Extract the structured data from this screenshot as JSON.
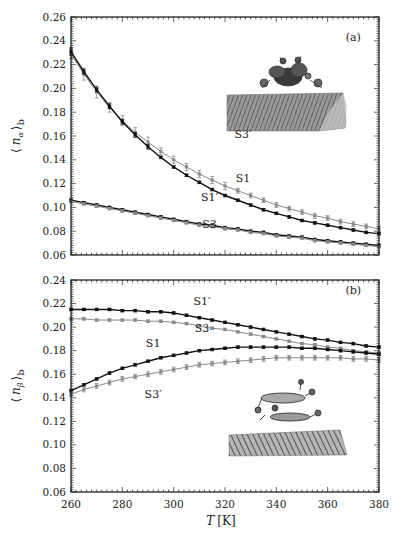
{
  "chart_data": [
    {
      "type": "line",
      "panel": "(a)",
      "xlabel": "",
      "ylabel": "⟨ n_α ⟩_b",
      "ylabel_main": "n",
      "ylabel_sub": "α",
      "ylabel_outer_sub": "b",
      "xlim": [
        260,
        380
      ],
      "ylim": [
        0.06,
        0.26
      ],
      "yticks": [
        0.06,
        0.08,
        0.1,
        0.12,
        0.14,
        0.16,
        0.18,
        0.2,
        0.22,
        0.24,
        0.26
      ],
      "ytick_labels": [
        "0.06",
        "0.08",
        "0.10",
        "0.12",
        "0.14",
        "0.16",
        "0.18",
        "0.20",
        "0.22",
        "0.24",
        "0.26"
      ],
      "x": [
        260,
        265,
        270,
        275,
        280,
        285,
        290,
        295,
        300,
        305,
        310,
        315,
        320,
        325,
        330,
        335,
        340,
        345,
        350,
        355,
        360,
        365,
        370,
        375,
        380
      ],
      "series": [
        {
          "name": "S3′",
          "color": "#8a8a8a",
          "values": [
            0.229,
            0.212,
            0.197,
            0.184,
            0.173,
            0.163,
            0.155,
            0.147,
            0.14,
            0.134,
            0.128,
            0.123,
            0.118,
            0.114,
            0.11,
            0.106,
            0.102,
            0.099,
            0.096,
            0.093,
            0.091,
            0.088,
            0.086,
            0.084,
            0.082
          ],
          "errors": [
            0.004,
            0.005,
            0.005,
            0.004,
            0.004,
            0.004,
            0.004,
            0.003,
            0.003,
            0.003,
            0.003,
            0.003,
            0.003,
            0.002,
            0.002,
            0.002,
            0.002,
            0.002,
            0.002,
            0.002,
            0.002,
            0.002,
            0.002,
            0.002,
            0.002
          ]
        },
        {
          "name": "S1",
          "color": "#111111",
          "values": [
            0.231,
            0.214,
            0.199,
            0.185,
            0.172,
            0.161,
            0.151,
            0.142,
            0.134,
            0.127,
            0.121,
            0.115,
            0.11,
            0.106,
            0.102,
            0.098,
            0.095,
            0.092,
            0.089,
            0.087,
            0.085,
            0.083,
            0.081,
            0.079,
            0.078
          ],
          "errors": [
            0.003,
            0.002,
            0.002,
            0.002,
            0.002,
            0.002,
            0.002,
            0.001,
            0.001,
            0.001,
            0.001,
            0.001,
            0.001,
            0.001,
            0.001,
            0.001,
            0.001,
            0.001,
            0.001,
            0.001,
            0.001,
            0.001,
            0.001,
            0.001,
            0.001
          ]
        },
        {
          "name": "S1′",
          "color": "#111111",
          "values": [
            0.106,
            0.104,
            0.102,
            0.1,
            0.098,
            0.096,
            0.094,
            0.092,
            0.09,
            0.088,
            0.086,
            0.085,
            0.083,
            0.082,
            0.08,
            0.079,
            0.077,
            0.076,
            0.075,
            0.073,
            0.072,
            0.071,
            0.07,
            0.069,
            0.068
          ],
          "errors": [
            0.001,
            0.001,
            0.001,
            0.001,
            0.001,
            0.001,
            0.001,
            0.001,
            0.001,
            0.001,
            0.001,
            0.001,
            0.001,
            0.001,
            0.001,
            0.001,
            0.001,
            0.001,
            0.001,
            0.001,
            0.001,
            0.001,
            0.001,
            0.001,
            0.001
          ]
        },
        {
          "name": "S3",
          "color": "#8a8a8a",
          "values": [
            0.105,
            0.103,
            0.101,
            0.099,
            0.097,
            0.095,
            0.093,
            0.091,
            0.089,
            0.087,
            0.085,
            0.084,
            0.082,
            0.081,
            0.079,
            0.078,
            0.076,
            0.075,
            0.074,
            0.072,
            0.071,
            0.07,
            0.069,
            0.068,
            0.067
          ],
          "errors": [
            0.001,
            0.001,
            0.001,
            0.001,
            0.001,
            0.001,
            0.001,
            0.001,
            0.001,
            0.001,
            0.001,
            0.001,
            0.001,
            0.001,
            0.001,
            0.001,
            0.001,
            0.001,
            0.001,
            0.001,
            0.001,
            0.001,
            0.001,
            0.001,
            0.001
          ]
        }
      ],
      "annotations": [
        {
          "text": "S3′",
          "x": 327,
          "y": 0.158
        },
        {
          "text": "S1",
          "x": 327,
          "y": 0.121
        },
        {
          "text": "S1′",
          "x": 314,
          "y": 0.105
        },
        {
          "text": "S3",
          "x": 314,
          "y": 0.083
        },
        {
          "text": "(a)",
          "x": 370,
          "y": 0.24
        }
      ],
      "inset": "molecule adsorbed on surface"
    },
    {
      "type": "line",
      "panel": "(b)",
      "xlabel": "T [K]",
      "xlabel_var": "T",
      "xlabel_unit": "[K]",
      "ylabel": "⟨ n_β ⟩_b",
      "ylabel_main": "n",
      "ylabel_sub": "β",
      "ylabel_outer_sub": "b",
      "xlim": [
        260,
        380
      ],
      "ylim": [
        0.06,
        0.24
      ],
      "xticks": [
        260,
        280,
        300,
        320,
        340,
        360,
        380
      ],
      "xtick_labels": [
        "260",
        "280",
        "300",
        "320",
        "340",
        "360",
        "380"
      ],
      "yticks": [
        0.06,
        0.08,
        0.1,
        0.12,
        0.14,
        0.16,
        0.18,
        0.2,
        0.22,
        0.24
      ],
      "ytick_labels": [
        "0.06",
        "0.08",
        "0.10",
        "0.12",
        "0.14",
        "0.16",
        "0.18",
        "0.20",
        "0.22",
        "0.24"
      ],
      "x": [
        260,
        265,
        270,
        275,
        280,
        285,
        290,
        295,
        300,
        305,
        310,
        315,
        320,
        325,
        330,
        335,
        340,
        345,
        350,
        355,
        360,
        365,
        370,
        375,
        380
      ],
      "series": [
        {
          "name": "S1′",
          "color": "#111111",
          "values": [
            0.215,
            0.215,
            0.215,
            0.215,
            0.214,
            0.214,
            0.213,
            0.213,
            0.212,
            0.21,
            0.208,
            0.206,
            0.204,
            0.202,
            0.2,
            0.198,
            0.196,
            0.194,
            0.192,
            0.19,
            0.189,
            0.187,
            0.186,
            0.184,
            0.183
          ],
          "errors": [
            0.001,
            0.001,
            0.001,
            0.001,
            0.001,
            0.001,
            0.001,
            0.001,
            0.001,
            0.001,
            0.001,
            0.001,
            0.001,
            0.001,
            0.001,
            0.001,
            0.001,
            0.001,
            0.001,
            0.001,
            0.001,
            0.001,
            0.001,
            0.001,
            0.001
          ]
        },
        {
          "name": "S3",
          "color": "#8a8a8a",
          "values": [
            0.207,
            0.207,
            0.206,
            0.206,
            0.206,
            0.206,
            0.205,
            0.205,
            0.204,
            0.203,
            0.201,
            0.199,
            0.198,
            0.196,
            0.194,
            0.192,
            0.19,
            0.188,
            0.186,
            0.185,
            0.183,
            0.182,
            0.18,
            0.179,
            0.178
          ],
          "errors": [
            0.001,
            0.001,
            0.001,
            0.001,
            0.001,
            0.001,
            0.001,
            0.001,
            0.001,
            0.001,
            0.001,
            0.001,
            0.001,
            0.001,
            0.001,
            0.001,
            0.001,
            0.001,
            0.001,
            0.001,
            0.001,
            0.001,
            0.001,
            0.001,
            0.001
          ]
        },
        {
          "name": "S1",
          "color": "#111111",
          "values": [
            0.146,
            0.151,
            0.156,
            0.161,
            0.165,
            0.168,
            0.171,
            0.174,
            0.176,
            0.178,
            0.18,
            0.181,
            0.182,
            0.183,
            0.183,
            0.183,
            0.183,
            0.183,
            0.182,
            0.182,
            0.181,
            0.18,
            0.179,
            0.178,
            0.177
          ],
          "errors": [
            0.001,
            0.001,
            0.001,
            0.001,
            0.001,
            0.001,
            0.001,
            0.001,
            0.001,
            0.001,
            0.001,
            0.001,
            0.001,
            0.001,
            0.001,
            0.001,
            0.001,
            0.001,
            0.001,
            0.001,
            0.001,
            0.001,
            0.001,
            0.001,
            0.001
          ]
        },
        {
          "name": "S3′",
          "color": "#8a8a8a",
          "values": [
            0.143,
            0.147,
            0.15,
            0.153,
            0.156,
            0.158,
            0.16,
            0.162,
            0.164,
            0.166,
            0.168,
            0.169,
            0.17,
            0.171,
            0.172,
            0.173,
            0.174,
            0.174,
            0.174,
            0.174,
            0.174,
            0.174,
            0.173,
            0.173,
            0.172
          ],
          "errors": [
            0.002,
            0.002,
            0.002,
            0.002,
            0.002,
            0.002,
            0.002,
            0.002,
            0.002,
            0.002,
            0.002,
            0.002,
            0.002,
            0.002,
            0.002,
            0.002,
            0.002,
            0.002,
            0.002,
            0.002,
            0.002,
            0.002,
            0.002,
            0.002,
            0.002
          ]
        }
      ],
      "annotations": [
        {
          "text": "S1′",
          "x": 311,
          "y": 0.219
        },
        {
          "text": "S3",
          "x": 311,
          "y": 0.196
        },
        {
          "text": "S1",
          "x": 292,
          "y": 0.183
        },
        {
          "text": "S3′",
          "x": 292,
          "y": 0.14
        },
        {
          "text": "(b)",
          "x": 370,
          "y": 0.228
        }
      ],
      "inset": "molecule adsorbed on surface"
    }
  ]
}
